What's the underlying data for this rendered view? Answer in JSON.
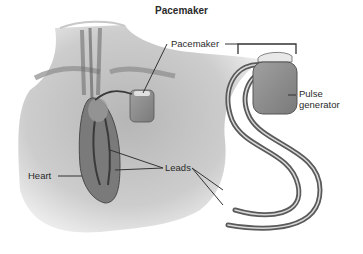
{
  "title": "Pacemaker",
  "labels": {
    "pacemaker": "Pacemaker",
    "pulse_generator_line1": "Pulse",
    "pulse_generator_line2": "generator",
    "heart": "Heart",
    "leads": "Leads"
  },
  "colors": {
    "background": "#ffffff",
    "text": "#2a2a2a",
    "body_shade": "#b8b8b8",
    "device": "#8a8a8a",
    "lead": "#5a5a5a"
  }
}
